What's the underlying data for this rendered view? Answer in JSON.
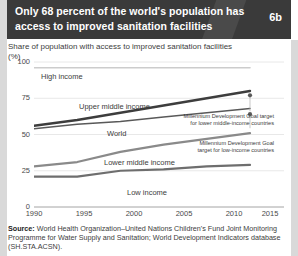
{
  "header": {
    "title": "Only 68 percent of the world's population has access to improved sanitation facilities",
    "badge": "6b",
    "bg_color": "#3a3a3a"
  },
  "subtitle": "Share of population with access to improved sanitation facilities",
  "unit": "(%)",
  "source": {
    "label": "Source:",
    "text": "World Health Organization–United Nations Children's Fund Joint Monitoring Programme for Water Supply and Sanitation; World Development Indicators database (SH.STA.ACSN)."
  },
  "chart_data": {
    "type": "line",
    "title": "Share of population with access to improved sanitation facilities",
    "xlabel": "",
    "ylabel": "(%)",
    "xlim": [
      1990,
      2015
    ],
    "ylim": [
      0,
      100
    ],
    "yticks": [
      "0",
      "25",
      "50",
      "75",
      "100"
    ],
    "xticks": [
      "1990",
      "1995",
      "2000",
      "2005",
      "2010",
      "2015"
    ],
    "grid": true,
    "legend": "inline-labels",
    "x": [
      1990,
      1995,
      2000,
      2005,
      2010,
      2015
    ],
    "series": [
      {
        "name": "High income",
        "label": "High income",
        "color": "#cccccc",
        "width": 1.6,
        "values": [
          96,
          96,
          96,
          96,
          96,
          96
        ]
      },
      {
        "name": "Upper middle income",
        "label": "Upper middle income",
        "color": "#3d3d3d",
        "width": 2.4,
        "values": [
          56,
          60,
          65,
          70,
          75,
          80
        ]
      },
      {
        "name": "World",
        "label": "World",
        "color": "#595959",
        "width": 1.5,
        "values": [
          54,
          57,
          59,
          62,
          65,
          68
        ]
      },
      {
        "name": "Lower middle income",
        "label": "Lower middle income",
        "color": "#8a8a8a",
        "width": 2.2,
        "values": [
          28,
          31,
          38,
          43,
          47,
          51
        ]
      },
      {
        "name": "Low income",
        "label": "Low income",
        "color": "#6e6e6e",
        "width": 2.2,
        "values": [
          21,
          21,
          25,
          26,
          28,
          29
        ]
      }
    ],
    "annotations": [
      {
        "name": "mdg-lower-middle-income",
        "line1": "Millennium Development Goal target",
        "line2": "for lower middle-income countries",
        "x": 2015,
        "y": 77,
        "marker": "dot"
      },
      {
        "name": "mdg-low-income",
        "line1": "Millennium Development Goal",
        "line2": "target for low-income countries",
        "x": 2015,
        "y": 64,
        "marker": "dot"
      }
    ]
  }
}
